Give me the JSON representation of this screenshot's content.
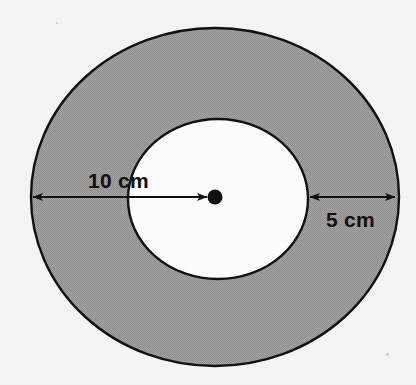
{
  "figure": {
    "background_color": "#f5f5f5",
    "shaded_fill_color": "#a0a0a0",
    "inner_fill_color": "#fdfdfd",
    "outline_color": "#111111",
    "arrow_color": "#111111",
    "center_dot": {
      "name": "center-point",
      "cx": 215,
      "cy": 197,
      "r": 7
    },
    "outer_circle": {
      "name": "outer-circle",
      "cx": 215,
      "cy": 197,
      "rx": 184,
      "ry": 169
    },
    "inner_circle": {
      "name": "inner-circle",
      "cx": 218,
      "cy": 199,
      "rx": 90,
      "ry": 80
    },
    "dimensions": [
      {
        "id": "radius-dimension",
        "label": "10 cm",
        "value": 10,
        "unit": "cm",
        "meaning": "radius of outer circle",
        "arrow": {
          "x1": 31,
          "x2": 209,
          "y": 197,
          "head_start": true,
          "head_end": true
        },
        "label_x": 88,
        "label_y": 188
      },
      {
        "id": "ring-width-dimension",
        "label": "5 cm",
        "value": 5,
        "unit": "cm",
        "meaning": "width of shaded ring",
        "arrow": {
          "x1": 308,
          "x2": 397,
          "y": 197,
          "head_start": true,
          "head_end": true
        },
        "label_x": 326,
        "label_y": 227
      }
    ]
  }
}
